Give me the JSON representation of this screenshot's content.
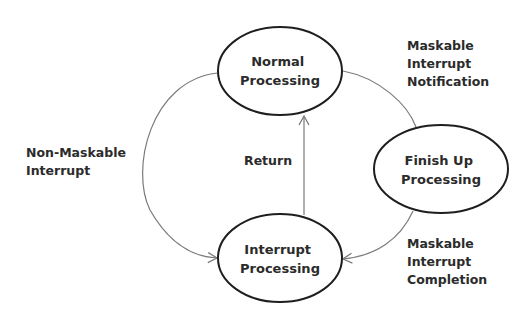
{
  "diagram": {
    "type": "state-diagram",
    "nodes": [
      {
        "id": "normal",
        "lines": [
          "Normal",
          "Processing"
        ],
        "cx": 280,
        "cy": 71,
        "rx": 62,
        "ry": 44
      },
      {
        "id": "interrupt",
        "lines": [
          "Interrupt",
          "Processing"
        ],
        "cx": 280,
        "cy": 258,
        "rx": 62,
        "ry": 44
      },
      {
        "id": "finish",
        "lines": [
          "Finish Up",
          "Processing"
        ],
        "cx": 441,
        "cy": 169,
        "rx": 67,
        "ry": 44
      }
    ],
    "edges": [
      {
        "id": "non-maskable",
        "from": "normal",
        "to": "interrupt",
        "label_lines": [
          "Non-Maskable",
          "Interrupt"
        ]
      },
      {
        "id": "return",
        "from": "interrupt",
        "to": "normal",
        "label_lines": [
          "Return"
        ]
      },
      {
        "id": "maskable-notification",
        "from": "normal",
        "to": "finish",
        "label_lines": [
          "Maskable",
          "Interrupt",
          "Notification"
        ]
      },
      {
        "id": "maskable-completion",
        "from": "finish",
        "to": "interrupt",
        "label_lines": [
          "Maskable",
          "Interrupt",
          "Completion"
        ]
      }
    ],
    "colors": {
      "node_stroke": "#1e1e1e",
      "edge_stroke": "#7a7a7a",
      "text": "#2b2b2b",
      "background": "#ffffff"
    }
  }
}
